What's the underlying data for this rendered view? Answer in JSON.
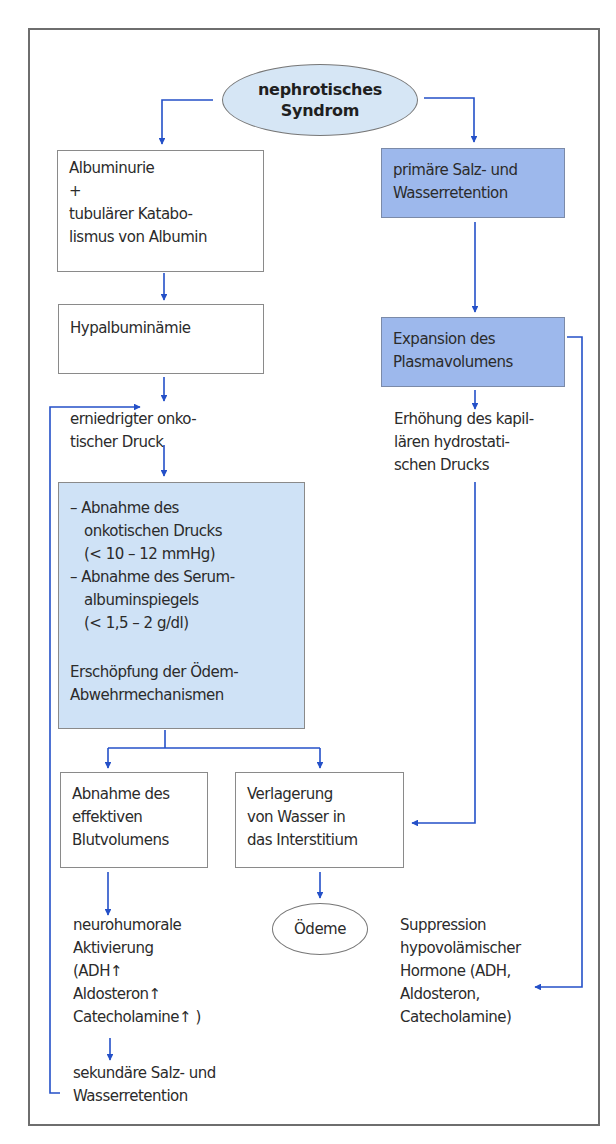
{
  "diagram": {
    "title_node": {
      "lines": [
        "nephrotisches",
        "Syndrom"
      ]
    },
    "left_branch": {
      "albuminuria_box": {
        "lines": [
          "Albuminurie",
          "+",
          "tubulärer Katabo-",
          "lismus von Albumin"
        ]
      },
      "hypalbuminemia_box": {
        "lines": [
          "Hypalbuminämie"
        ]
      },
      "oncotic_pressure_text": {
        "lines": [
          "erniedrigter onko-",
          "tischer Druck"
        ]
      },
      "exhaustion_box": {
        "lines": [
          "– Abnahme des",
          "onkotischen Drucks",
          "(< 10 – 12 mmHg)",
          "– Abnahme des Serum-",
          "albuminspiegels",
          "(< 1,5 – 2 g/dl)"
        ],
        "conclusion_lines": [
          "Erschöpfung der Ödem-",
          "Abwehrmechanismen"
        ]
      },
      "blood_volume_box": {
        "lines": [
          "Abnahme des",
          "effektiven",
          "Blutvolumens"
        ]
      },
      "neurohumoral_text": {
        "lines": [
          "neurohumorale",
          "Aktivierung",
          "(ADH↑",
          "Aldosteron↑",
          "Catecholamine↑ )"
        ]
      },
      "secondary_retention_text": {
        "lines": [
          "sekundäre Salz- und",
          "Wasserretention"
        ]
      }
    },
    "middle": {
      "interstitium_box": {
        "lines": [
          "Verlagerung",
          "von Wasser in",
          "das Interstitium"
        ]
      },
      "edema_node": {
        "lines": [
          "Ödeme"
        ]
      }
    },
    "right_branch": {
      "primary_retention_box": {
        "lines": [
          "primäre Salz- und",
          "Wasserretention"
        ]
      },
      "plasma_expansion_box": {
        "lines": [
          "Expansion des",
          "Plasmavolumens"
        ]
      },
      "hydrostatic_text": {
        "lines": [
          "Erhöhung des kapil-",
          "lären hydrostati-",
          "schen Drucks"
        ]
      },
      "suppression_text": {
        "lines": [
          "Suppression",
          "hypovolämischer",
          "Hormone (ADH,",
          "Aldosteron,",
          "Catecholamine)"
        ]
      }
    },
    "colors": {
      "arrow": "#2450c8",
      "dark_box": "#9db8ec",
      "light_box": "#cfe2f6",
      "ellipse_fill": "#d6e6f5",
      "frame": "#6e6e6e"
    }
  }
}
